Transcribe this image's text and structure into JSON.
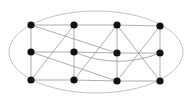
{
  "diagram": {
    "type": "graph",
    "colors": {
      "node": "#111111",
      "edge": "#8a8a8a",
      "ellipse": "#9a9a9a",
      "background": "#ffffff"
    },
    "ellipse": {
      "cx": 96,
      "cy": 52,
      "rx": 87,
      "ry": 41
    },
    "nodes": [
      {
        "id": "A1",
        "x": 31,
        "y": 25
      },
      {
        "id": "A2",
        "x": 74,
        "y": 25
      },
      {
        "id": "A3",
        "x": 117,
        "y": 25
      },
      {
        "id": "A4",
        "x": 160,
        "y": 26
      },
      {
        "id": "B1",
        "x": 31,
        "y": 52
      },
      {
        "id": "B2",
        "x": 74,
        "y": 52
      },
      {
        "id": "B3",
        "x": 117,
        "y": 53
      },
      {
        "id": "B4",
        "x": 160,
        "y": 53
      },
      {
        "id": "C1",
        "x": 31,
        "y": 80
      },
      {
        "id": "C2",
        "x": 74,
        "y": 80
      },
      {
        "id": "C3",
        "x": 117,
        "y": 81
      },
      {
        "id": "C4",
        "x": 160,
        "y": 81
      }
    ],
    "edges": [
      [
        "A1",
        "A2"
      ],
      [
        "A2",
        "A3"
      ],
      [
        "A3",
        "A4"
      ],
      [
        "B1",
        "B2"
      ],
      [
        "B2",
        "B3"
      ],
      [
        "B3",
        "B4"
      ],
      [
        "C1",
        "C2"
      ],
      [
        "C2",
        "C3"
      ],
      [
        "C3",
        "C4"
      ],
      [
        "A1",
        "B1"
      ],
      [
        "B1",
        "C1"
      ],
      [
        "A2",
        "B2"
      ],
      [
        "B2",
        "C2"
      ],
      [
        "A3",
        "B3"
      ],
      [
        "B3",
        "C3"
      ],
      [
        "A4",
        "B4"
      ],
      [
        "B4",
        "C4"
      ],
      [
        "A1",
        "B3"
      ],
      [
        "B1",
        "C3"
      ],
      [
        "A2",
        "C1"
      ],
      [
        "A3",
        "C2"
      ],
      [
        "A3",
        "C4"
      ],
      [
        "A4",
        "C3"
      ]
    ],
    "curved_edges": [
      {
        "from": "B2",
        "to": "B4",
        "control": {
          "x": 117,
          "y": 70
        }
      }
    ]
  }
}
